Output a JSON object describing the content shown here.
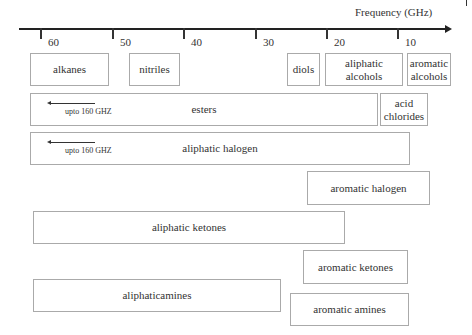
{
  "axis": {
    "title": "Frequency (GHz)",
    "ticks": [
      {
        "label": "60",
        "x": 40
      },
      {
        "label": "50",
        "x": 112
      },
      {
        "label": "40",
        "x": 183
      },
      {
        "label": "30",
        "x": 255
      },
      {
        "label": "20",
        "x": 326
      },
      {
        "label": "10",
        "x": 397
      }
    ],
    "direction": "decreasing left-to-right"
  },
  "boxes": [
    {
      "id": "alkanes",
      "label": "alkanes",
      "x": 30,
      "y": 53,
      "w": 79,
      "h": 33
    },
    {
      "id": "nitriles",
      "label": "nitriles",
      "x": 129,
      "y": 53,
      "w": 51,
      "h": 33
    },
    {
      "id": "diols",
      "label": "diols",
      "x": 287,
      "y": 53,
      "w": 33,
      "h": 33
    },
    {
      "id": "aliphatic-alcohols",
      "label": "aliphatic\nalcohols",
      "x": 325,
      "y": 53,
      "w": 78,
      "h": 33
    },
    {
      "id": "aromatic-alcohols",
      "label": "aromatic\nalcohols",
      "x": 407,
      "y": 53,
      "w": 44,
      "h": 33
    },
    {
      "id": "esters",
      "label": "esters",
      "x": 30,
      "y": 93,
      "w": 348,
      "h": 33,
      "note": "upto 160 GHZ"
    },
    {
      "id": "acid-chlorides",
      "label": "acid\nchlorides",
      "x": 380,
      "y": 93,
      "w": 48,
      "h": 33
    },
    {
      "id": "aliphatic-halogen",
      "label": "aliphatic halogen",
      "x": 30,
      "y": 132,
      "w": 380,
      "h": 33,
      "note": "upto 160 GHZ"
    },
    {
      "id": "aromatic-halogen",
      "label": "aromatic halogen",
      "x": 307,
      "y": 171,
      "w": 123,
      "h": 34
    },
    {
      "id": "aliphatic-ketones",
      "label": "aliphatic ketones",
      "x": 33,
      "y": 211,
      "w": 312,
      "h": 33
    },
    {
      "id": "aromatic-ketones",
      "label": "aromatic ketones",
      "x": 303,
      "y": 250,
      "w": 105,
      "h": 34
    },
    {
      "id": "aliphaticamines",
      "label": "aliphaticamines",
      "x": 33,
      "y": 279,
      "w": 248,
      "h": 33
    },
    {
      "id": "aromatic-amines",
      "label": "aromatic amines",
      "x": 290,
      "y": 293,
      "w": 119,
      "h": 33
    }
  ],
  "notes": {
    "esters": "upto 160 GHZ",
    "aliphatic_halogen": "upto 160 GHZ"
  }
}
